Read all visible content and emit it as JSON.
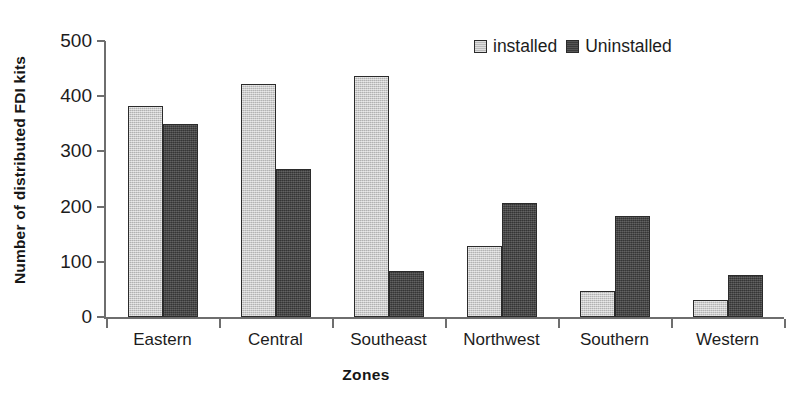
{
  "chart_data": {
    "type": "bar",
    "title": "",
    "xlabel": "Zones",
    "ylabel": "Number of distributed FDI kits",
    "categories": [
      "Eastern",
      "Central",
      "Southeast",
      "Northwest",
      "Southern",
      "Western"
    ],
    "series": [
      {
        "name": "installed",
        "color": "#c3c3c3",
        "values": [
          383,
          422,
          437,
          128,
          47,
          30
        ]
      },
      {
        "name": "Uninstalled",
        "color": "#434343",
        "values": [
          350,
          268,
          84,
          206,
          183,
          77
        ]
      }
    ],
    "ylim": [
      0,
      500
    ],
    "yticks": [
      0,
      100,
      200,
      300,
      400,
      500
    ],
    "ytick_labels": [
      "0",
      "100",
      "200",
      "300",
      "400",
      "500"
    ],
    "grid": false,
    "legend_position": "top-right",
    "legend_entries": [
      "installed",
      "Uninstalled"
    ]
  },
  "axis": {
    "line_color": "#6e6e6e"
  }
}
